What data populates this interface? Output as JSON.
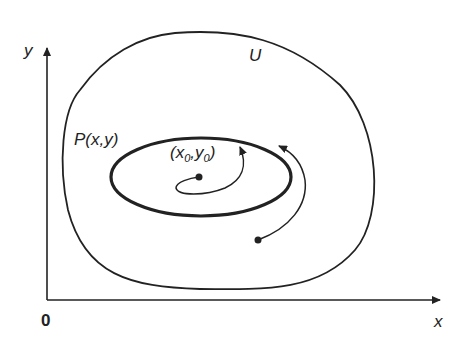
{
  "diagram": {
    "type": "phase-portrait-stability",
    "axes": {
      "x_label": "x",
      "y_label": "y",
      "origin_label": "0"
    },
    "region_label": "U",
    "limit_cycle_label": "P(x,y)",
    "equilibrium_label": {
      "prefix": "(x",
      "sub1": "0",
      "mid": ",y",
      "sub2": "0",
      "suffix": ")"
    },
    "colors": {
      "stroke": "#222222",
      "background": "#ffffff"
    }
  }
}
